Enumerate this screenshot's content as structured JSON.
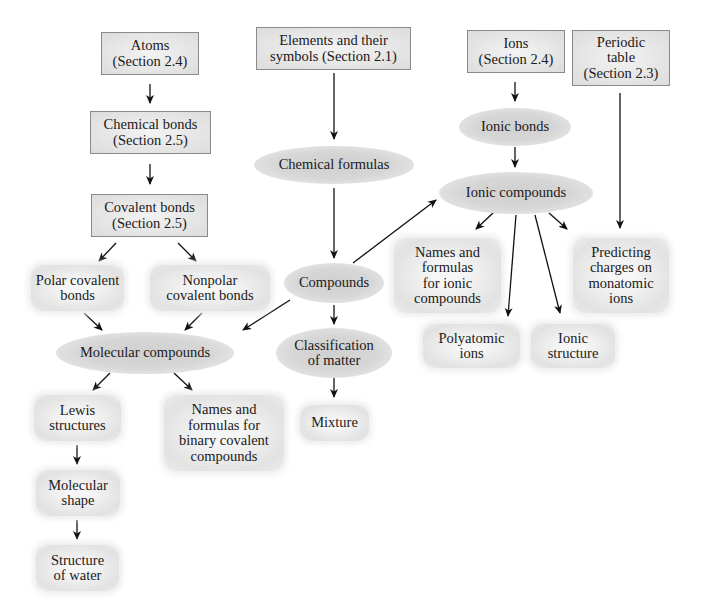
{
  "diagram": {
    "nodes": {
      "atoms": "Atoms\n(Section 2.4)",
      "chemical_bonds": "Chemical bonds\n(Section 2.5)",
      "covalent_bonds": "Covalent bonds\n(Section 2.5)",
      "elements": "Elements and their\nsymbols (Section 2.1)",
      "ions": "Ions\n(Section 2.4)",
      "periodic_table": "Periodic\ntable\n(Section 2.3)",
      "chemical_formulas": "Chemical formulas",
      "ionic_bonds": "Ionic bonds",
      "ionic_compounds": "Ionic compounds",
      "polar_covalent": "Polar covalent\nbonds",
      "nonpolar_covalent": "Nonpolar\ncovalent bonds",
      "compounds": "Compounds",
      "names_ionic": "Names and\nformulas\nfor ionic\ncompounds",
      "predicting_charges": "Predicting\ncharges on\nmonatomic\nions",
      "molecular_compounds": "Molecular compounds",
      "classification": "Classification\nof matter",
      "polyatomic_ions": "Polyatomic\nions",
      "ionic_structure": "Ionic\nstructure",
      "lewis": "Lewis\nstructures",
      "names_binary": "Names and\nformulas for\nbinary covalent\ncompounds",
      "mixture": "Mixture",
      "molecular_shape": "Molecular\nshape",
      "structure_water": "Structure\nof water"
    },
    "edges": [
      [
        "atoms",
        "chemical_bonds"
      ],
      [
        "chemical_bonds",
        "covalent_bonds"
      ],
      [
        "covalent_bonds",
        "polar_covalent"
      ],
      [
        "covalent_bonds",
        "nonpolar_covalent"
      ],
      [
        "polar_covalent",
        "molecular_compounds"
      ],
      [
        "nonpolar_covalent",
        "molecular_compounds"
      ],
      [
        "molecular_compounds",
        "lewis"
      ],
      [
        "molecular_compounds",
        "names_binary"
      ],
      [
        "lewis",
        "molecular_shape"
      ],
      [
        "molecular_shape",
        "structure_water"
      ],
      [
        "elements",
        "chemical_formulas"
      ],
      [
        "chemical_formulas",
        "compounds"
      ],
      [
        "compounds",
        "ionic_compounds"
      ],
      [
        "compounds",
        "molecular_compounds"
      ],
      [
        "compounds",
        "classification"
      ],
      [
        "classification",
        "mixture"
      ],
      [
        "ions",
        "ionic_bonds"
      ],
      [
        "ionic_bonds",
        "ionic_compounds"
      ],
      [
        "ionic_compounds",
        "names_ionic"
      ],
      [
        "ionic_compounds",
        "polyatomic_ions"
      ],
      [
        "ionic_compounds",
        "ionic_structure"
      ],
      [
        "ionic_compounds",
        "predicting_charges"
      ],
      [
        "periodic_table",
        "predicting_charges"
      ]
    ]
  }
}
